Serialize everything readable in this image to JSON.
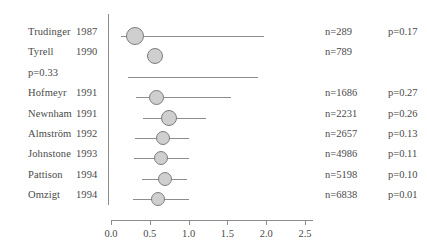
{
  "chart_data": {
    "type": "scatter",
    "subtype": "forest-plot",
    "title": "",
    "xlabel": "",
    "ylabel": "",
    "xlim": [
      0.0,
      2.6
    ],
    "xticks": [
      0.0,
      0.5,
      1.0,
      1.5,
      2.0,
      2.5
    ],
    "xtick_labels": [
      "0.0",
      "0.5",
      "1.0",
      "1.5",
      "2.0",
      "2.5"
    ],
    "grid": false,
    "legend": "none",
    "reference_line": 0.0,
    "rows": [
      {
        "name": "Trudinger",
        "year": "1987",
        "n_label": "n=289",
        "p_label": "p=0.17",
        "estimate": 0.31,
        "ci_low": 0.13,
        "ci_high": 1.97,
        "marker_size": 18,
        "has_marker": true,
        "has_ci": true
      },
      {
        "name": "Tyrell",
        "year": "1990",
        "n_label": "n=789",
        "p_label": "",
        "estimate": 0.57,
        "ci_low": null,
        "ci_high": null,
        "marker_size": 16,
        "has_marker": true,
        "has_ci": false
      },
      {
        "name": "p=0.33",
        "year": "",
        "n_label": "",
        "p_label": "",
        "estimate": null,
        "ci_low": 0.22,
        "ci_high": 1.89,
        "marker_size": 0,
        "has_marker": false,
        "has_ci": true
      },
      {
        "name": "Hofmeyr",
        "year": "1991",
        "n_label": "n=1686",
        "p_label": "p=0.27",
        "estimate": 0.58,
        "ci_low": 0.32,
        "ci_high": 1.55,
        "marker_size": 15,
        "has_marker": true,
        "has_ci": true
      },
      {
        "name": "Newnham",
        "year": "1991",
        "n_label": "n=2231",
        "p_label": "p=0.26",
        "estimate": 0.75,
        "ci_low": 0.41,
        "ci_high": 1.22,
        "marker_size": 16,
        "has_marker": true,
        "has_ci": true
      },
      {
        "name": "Almström",
        "year": "1992",
        "n_label": "n=2657",
        "p_label": "p=0.13",
        "estimate": 0.67,
        "ci_low": 0.31,
        "ci_high": 1.01,
        "marker_size": 14,
        "has_marker": true,
        "has_ci": true
      },
      {
        "name": "Johnstone",
        "year": "1993",
        "n_label": "n=4986",
        "p_label": "p=0.11",
        "estimate": 0.65,
        "ci_low": 0.3,
        "ci_high": 1.01,
        "marker_size": 14,
        "has_marker": true,
        "has_ci": true
      },
      {
        "name": "Pattison",
        "year": "1994",
        "n_label": "n=5198",
        "p_label": "p=0.10",
        "estimate": 0.7,
        "ci_low": 0.4,
        "ci_high": 0.98,
        "marker_size": 14,
        "has_marker": true,
        "has_ci": true
      },
      {
        "name": "Omzigt",
        "year": "1994",
        "n_label": "n=6838",
        "p_label": "p=0.01",
        "estimate": 0.61,
        "ci_low": 0.28,
        "ci_high": 1.0,
        "marker_size": 14,
        "has_marker": true,
        "has_ci": true
      }
    ]
  },
  "colors": {
    "marker_fill": "#cfcfcf",
    "marker_stroke": "#7d7d7d",
    "line": "#8c8c8c",
    "text": "#4a4a4a",
    "background": "#ffffff"
  },
  "layout": {
    "name_x": 28,
    "year_x": 76,
    "n_x": 325,
    "p_x": 388,
    "axis_x0_px": 111,
    "axis_px_per_unit": 77.6,
    "vline_x": 108,
    "vline_top": 14,
    "vline_bottom": 205,
    "axis_y": 220,
    "row_top": 26,
    "row_step": 20.4,
    "tick_label_y": 228
  }
}
